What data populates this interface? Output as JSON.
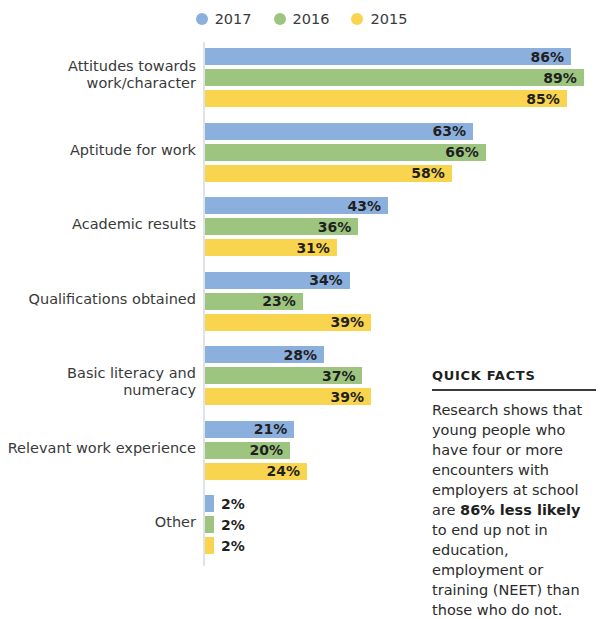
{
  "legend": {
    "items": [
      {
        "label": "2017",
        "color": "#8cb0de",
        "icon": "legend-dot-icon"
      },
      {
        "label": "2016",
        "color": "#9dc57f",
        "icon": "legend-dot-icon"
      },
      {
        "label": "2015",
        "color": "#f9d44e",
        "icon": "legend-dot-icon"
      }
    ]
  },
  "quick_facts": {
    "title": "QUICK FACTS",
    "text_before": "Research shows that young people who have four or more encounters with employers at school are ",
    "highlight": "86% less likely",
    "text_after": " to end up not in education, employment or training (NEET) than those who do not."
  },
  "chart_data": {
    "type": "bar",
    "orientation": "horizontal",
    "title": "",
    "xlabel": "",
    "ylabel": "",
    "xlim": [
      0,
      89
    ],
    "grid": false,
    "legend_position": "top-center",
    "value_suffix": "%",
    "categories": [
      "Attitudes towards work/character",
      "Aptitude for work",
      "Academic results",
      "Qualifications obtained",
      "Basic literacy and numeracy",
      "Relevant work experience",
      "Other"
    ],
    "series": [
      {
        "name": "2017",
        "color": "#8cb0de",
        "values": [
          86,
          63,
          43,
          34,
          28,
          21,
          2
        ]
      },
      {
        "name": "2016",
        "color": "#9dc57f",
        "values": [
          89,
          66,
          36,
          23,
          37,
          20,
          2
        ]
      },
      {
        "name": "2015",
        "color": "#f9d44e",
        "values": [
          85,
          58,
          31,
          39,
          39,
          24,
          2
        ]
      }
    ],
    "labels": [
      {
        "category": "Attitudes towards work/character",
        "values": [
          "86%",
          "89%",
          "85%"
        ]
      },
      {
        "category": "Aptitude for work",
        "values": [
          "63%",
          "66%",
          "58%"
        ]
      },
      {
        "category": "Academic results",
        "values": [
          "43%",
          "36%",
          "31%"
        ]
      },
      {
        "category": "Qualifications obtained",
        "values": [
          "34%",
          "23%",
          "39%"
        ]
      },
      {
        "category": "Basic literacy and numeracy",
        "values": [
          "28%",
          "37%",
          "39%"
        ]
      },
      {
        "category": "Relevant work experience",
        "values": [
          "21%",
          "20%",
          "24%"
        ]
      },
      {
        "category": "Other",
        "values": [
          "2%",
          "2%",
          "2%"
        ]
      }
    ]
  }
}
